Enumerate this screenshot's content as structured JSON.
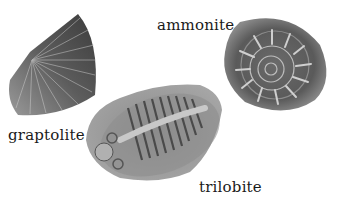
{
  "labels": {
    "graptolite": "graptolite",
    "ammonite": "ammonite",
    "trilobite": "trilobite"
  },
  "colors": {
    "background": "#ffffff",
    "fossil_dark": "#3a3a3a",
    "fossil_mid": "#7a7a7a",
    "fossil_light": "#b8b8b8",
    "text": "#1a1a1a"
  }
}
